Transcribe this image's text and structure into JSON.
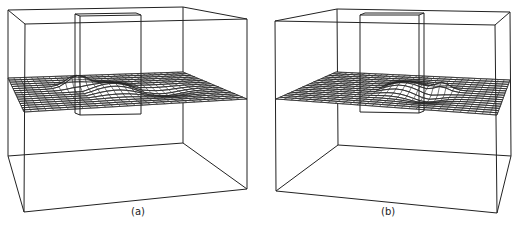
{
  "figure": {
    "stroke_color": "#222222",
    "background": "#ffffff",
    "panels": [
      {
        "id": "a",
        "caption": "(a)",
        "outer_box": {
          "back_top_left": [
            8,
            10
          ],
          "back_top_right": [
            183,
            7
          ],
          "front_top_left": [
            25,
            24
          ],
          "front_top_right": [
            247,
            19
          ],
          "back_bottom_left": [
            8,
            156
          ],
          "back_bottom_right": [
            183,
            143
          ],
          "front_bottom_left": [
            24,
            212
          ],
          "front_bottom_right": [
            247,
            189
          ]
        },
        "inner_block": {
          "front": [
            [
              80,
              16
            ],
            [
              141,
              15
            ],
            [
              141,
              114
            ],
            [
              80,
              115
            ]
          ],
          "back_offset": [
            -5,
            -2
          ]
        },
        "mesh": {
          "back_left": [
            8,
            78
          ],
          "back_right": [
            183,
            72
          ],
          "front_left": [
            24,
            112
          ],
          "front_right": [
            247,
            99
          ],
          "rows": 16,
          "cols": 30,
          "bump": {
            "u": 0.33,
            "v": 0.35,
            "height": 14,
            "spread": 0.05
          },
          "ridge": {
            "u_start": 0.34,
            "u_end": 0.62,
            "v": 0.5,
            "height": 7
          },
          "trough": {
            "u": 0.72,
            "v": 0.6,
            "depth": -4
          }
        }
      },
      {
        "id": "b",
        "caption": "(b)",
        "outer_box": {
          "back_top_left": [
            337,
            9
          ],
          "back_top_right": [
            510,
            12
          ],
          "front_top_left": [
            275,
            21
          ],
          "front_top_right": [
            495,
            25
          ],
          "back_bottom_left": [
            338,
            145
          ],
          "back_bottom_right": [
            511,
            156
          ],
          "front_bottom_left": [
            276,
            191
          ],
          "front_bottom_right": [
            497,
            213
          ]
        },
        "inner_block": {
          "front": [
            [
              360,
              15
            ],
            [
              419,
              15
            ],
            [
              419,
              113
            ],
            [
              360,
              112
            ]
          ],
          "back_offset": [
            5,
            -2
          ]
        },
        "mesh": {
          "back_left": [
            336,
            72
          ],
          "back_right": [
            510,
            80
          ],
          "front_left": [
            276,
            99
          ],
          "front_right": [
            497,
            115
          ],
          "rows": 16,
          "cols": 30,
          "bump": {
            "u": 0.67,
            "v": 0.4,
            "height": 9,
            "spread": 0.04
          },
          "ridge": {
            "u_start": 0.36,
            "u_end": 0.62,
            "v": 0.45,
            "height": 7
          },
          "trough": {
            "u": 0.62,
            "v": 0.62,
            "depth": -5
          }
        }
      }
    ]
  }
}
